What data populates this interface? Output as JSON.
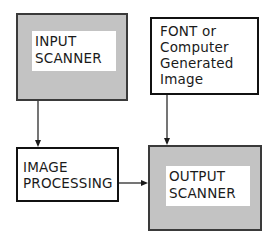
{
  "diagram": {
    "nodes": [
      {
        "id": "input_scanner",
        "lines": [
          "INPUT",
          "SCANNER"
        ],
        "style": "shaded"
      },
      {
        "id": "font_source",
        "lines": [
          "FONT or",
          "Computer",
          "Generated",
          "Image"
        ],
        "style": "plain"
      },
      {
        "id": "image_processing",
        "lines": [
          "IMAGE",
          "PROCESSING"
        ],
        "style": "plain"
      },
      {
        "id": "output_scanner",
        "lines": [
          "OUTPUT",
          "SCANNER"
        ],
        "style": "shaded"
      }
    ],
    "edges": [
      {
        "from": "input_scanner",
        "to": "image_processing"
      },
      {
        "from": "font_source",
        "to": "output_scanner"
      },
      {
        "from": "image_processing",
        "to": "output_scanner"
      }
    ],
    "colors": {
      "line": "#1a1a1a",
      "shade": "#d9d9d9"
    }
  }
}
